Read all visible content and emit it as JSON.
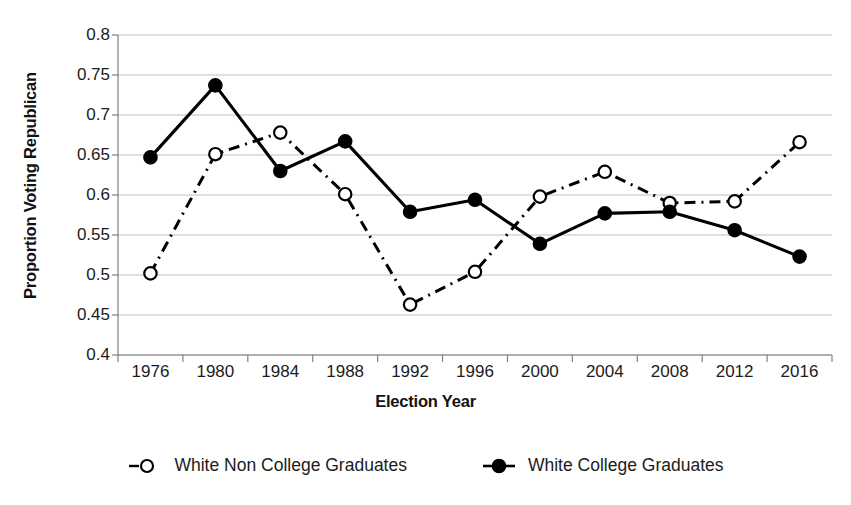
{
  "chart_data": {
    "type": "line",
    "title": "",
    "xlabel": "Election Year",
    "ylabel": "Proportion Voting Republican",
    "categories": [
      1976,
      1980,
      1984,
      1988,
      1992,
      1996,
      2000,
      2004,
      2008,
      2012,
      2016
    ],
    "xtick_labels": [
      "1976",
      "1980",
      "1984",
      "1988",
      "1992",
      "1996",
      "2000",
      "2004",
      "2008",
      "2012",
      "2016"
    ],
    "ytick_labels": [
      "0.8",
      "0.75",
      "0.7",
      "0.65",
      "0.6",
      "0.55",
      "0.5",
      "0.45",
      "0.4"
    ],
    "ytick_values": [
      0.8,
      0.75,
      0.7,
      0.65,
      0.6,
      0.55,
      0.5,
      0.45,
      0.4
    ],
    "ylim": [
      0.4,
      0.8
    ],
    "grid": "horizontal",
    "legend_position": "bottom",
    "series": [
      {
        "name": "White Non College Graduates",
        "marker": "open-circle",
        "line_style": "dash-dot",
        "color": "#000000",
        "values": [
          0.502,
          0.651,
          0.678,
          0.601,
          0.463,
          0.504,
          0.598,
          0.629,
          0.59,
          0.592,
          0.666
        ]
      },
      {
        "name": "White College Graduates",
        "marker": "filled-circle",
        "line_style": "solid",
        "color": "#000000",
        "values": [
          0.647,
          0.737,
          0.63,
          0.667,
          0.579,
          0.594,
          0.539,
          0.577,
          0.579,
          0.556,
          0.523
        ]
      }
    ]
  },
  "legend": {
    "items": [
      {
        "label": "White Non College Graduates",
        "marker": "open-circle"
      },
      {
        "label": "White College Graduates",
        "marker": "filled-circle"
      }
    ]
  },
  "axes": {
    "x_title": "Election Year",
    "y_title": "Proportion Voting Republican"
  },
  "style": {
    "ink": "#000000",
    "grid_color": "#bfbfbf",
    "axis_color": "#808080",
    "background": "#ffffff"
  }
}
